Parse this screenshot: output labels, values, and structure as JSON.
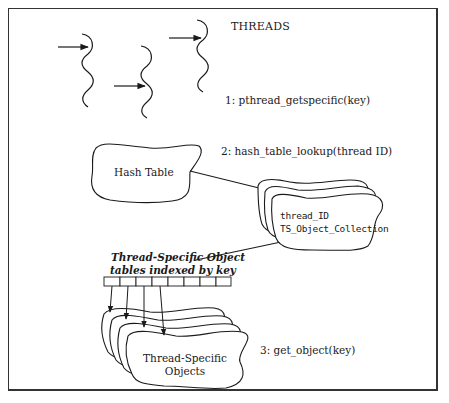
{
  "diagram": {
    "title": "THREADS",
    "steps": [
      {
        "label": "1: pthread_getspecific(key)"
      },
      {
        "label": "2: hash_table_lookup(thread ID)"
      },
      {
        "label": "3: get_object(key)"
      }
    ],
    "hash_table": {
      "label": "Hash Table"
    },
    "collection": {
      "line1": "thread_ID",
      "line2": "TS_Object_Collection"
    },
    "key_table": {
      "caption_line1": "Thread-Specific Object",
      "caption_line2": "tables indexed by key",
      "cell_count": 8,
      "arrow_count": 4
    },
    "objects": {
      "line1": "Thread-Specific",
      "line2": "Objects"
    },
    "threads_count": 3,
    "colors": {
      "stroke": "#1a1a1a",
      "background": "#ffffff"
    }
  }
}
